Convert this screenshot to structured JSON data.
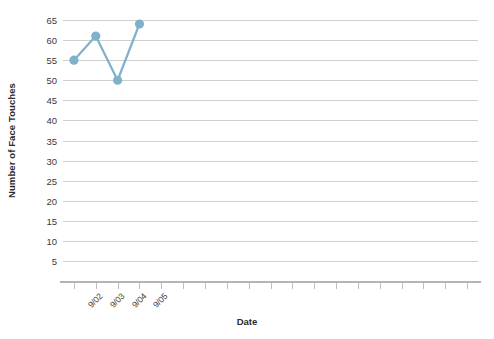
{
  "chart_data": {
    "type": "line",
    "title": "",
    "xlabel": "Date",
    "ylabel": "Number of Face Touches",
    "categories": [
      "9/02",
      "9/03",
      "9/04",
      "9/05"
    ],
    "values": [
      55,
      61,
      50,
      64
    ],
    "series": [
      {
        "name": "Number of Face Touches",
        "values": [
          55,
          61,
          50,
          64
        ],
        "color": "#7fb1cc",
        "marker": "circle"
      }
    ],
    "ylim": [
      5,
      65
    ],
    "ytick_step": 5,
    "ytick_labels": [
      "5",
      "10",
      "15",
      "20",
      "25",
      "30",
      "35",
      "40",
      "45",
      "50",
      "55",
      "60",
      "65"
    ],
    "grid": true,
    "grid_axis": "y",
    "grid_color": "#cfcfcf",
    "legend": false,
    "legend_position": "none",
    "x_total_ticks": 19,
    "x_labeled_ticks": 4,
    "axis_line_color": "#b4b4b4",
    "background": "#ffffff"
  },
  "axes": {
    "y_title": "Number of Face Touches",
    "x_title": "Date"
  }
}
